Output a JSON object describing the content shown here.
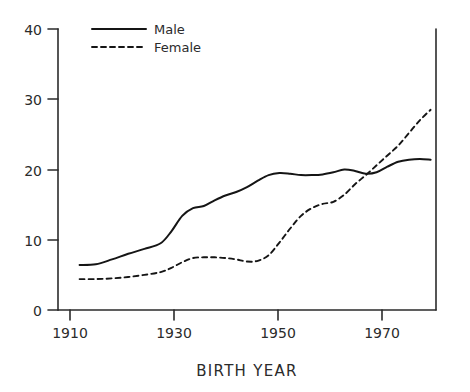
{
  "chart_data": {
    "type": "line",
    "title": "",
    "xlabel": "BIRTH YEAR",
    "ylabel": "",
    "xlim": [
      1907,
      1977
    ],
    "ylim": [
      0,
      40
    ],
    "xticks": [
      1910,
      1930,
      1950,
      1970
    ],
    "xtick_labels": [
      "1910",
      "1930",
      "1950",
      "1970"
    ],
    "yticks": [
      0,
      10,
      20,
      30,
      40
    ],
    "ytick_labels": [
      "0",
      "10",
      "20",
      "30",
      "40"
    ],
    "grid": false,
    "legend_position": "top-left",
    "style": "hand-drawn",
    "series": [
      {
        "name": "Male",
        "line_style": "solid",
        "x": [
          1911,
          1914,
          1917,
          1920,
          1923,
          1926,
          1928,
          1930,
          1932,
          1934,
          1936,
          1938,
          1940,
          1942,
          1944,
          1946,
          1948,
          1950,
          1952,
          1954,
          1956,
          1958,
          1960,
          1962,
          1964,
          1966,
          1968,
          1970,
          1972,
          1974,
          1976
        ],
        "y": [
          6.4,
          6.5,
          7.2,
          8.0,
          8.7,
          9.5,
          11.2,
          13.4,
          14.5,
          14.8,
          15.6,
          16.3,
          16.8,
          17.5,
          18.4,
          19.2,
          19.5,
          19.4,
          19.2,
          19.2,
          19.3,
          19.6,
          20.0,
          19.8,
          19.4,
          19.6,
          20.4,
          21.1,
          21.4,
          21.5,
          21.4
        ]
      },
      {
        "name": "Female",
        "line_style": "dashed",
        "x": [
          1911,
          1914,
          1917,
          1920,
          1923,
          1926,
          1928,
          1930,
          1932,
          1934,
          1936,
          1938,
          1940,
          1942,
          1944,
          1946,
          1948,
          1950,
          1952,
          1954,
          1956,
          1958,
          1960,
          1962,
          1964,
          1966,
          1968,
          1970,
          1972,
          1974,
          1976
        ],
        "y": [
          4.4,
          4.4,
          4.5,
          4.7,
          5.0,
          5.4,
          6.0,
          6.8,
          7.4,
          7.5,
          7.5,
          7.4,
          7.2,
          6.9,
          7.0,
          7.8,
          9.6,
          11.6,
          13.4,
          14.5,
          15.1,
          15.4,
          16.4,
          17.9,
          19.2,
          20.6,
          22.0,
          23.4,
          25.2,
          27.0,
          28.5
        ]
      }
    ]
  },
  "legend": {
    "entries": [
      {
        "label": "Male",
        "style": "solid"
      },
      {
        "label": "Female",
        "style": "dashed"
      }
    ]
  },
  "axes": {
    "x_title": "BIRTH YEAR"
  }
}
